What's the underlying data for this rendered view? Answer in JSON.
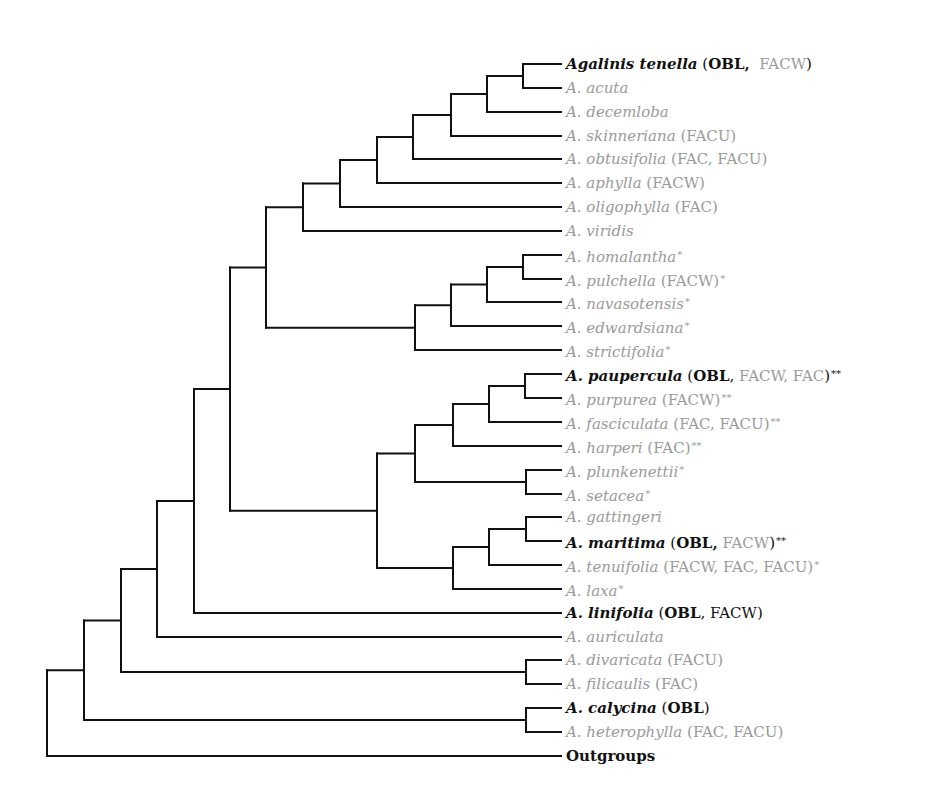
{
  "colors": {
    "branch": "#111111",
    "dark_text": "#111111",
    "gray_text": "#9a9a9a",
    "background": "#ffffff"
  },
  "leaves": [
    {
      "y": 64,
      "dark": true,
      "name": "Agalinis tenella",
      "tokens": [
        {
          "t": " (",
          "c": "dark"
        },
        {
          "t": "OBL,",
          "c": "bold"
        },
        {
          "t": "  FACW",
          "c": "gray"
        },
        {
          "t": ")",
          "c": "dark"
        }
      ],
      "mark": ""
    },
    {
      "y": 88,
      "dark": false,
      "name": "A. acuta",
      "tokens": [],
      "mark": ""
    },
    {
      "y": 112,
      "dark": false,
      "name": "A. decemloba",
      "tokens": [],
      "mark": ""
    },
    {
      "y": 136,
      "dark": false,
      "name": "A. skinneriana",
      "tokens": [
        {
          "t": " (FACU)",
          "c": "gray"
        }
      ],
      "mark": ""
    },
    {
      "y": 159,
      "dark": false,
      "name": "A. obtusifolia",
      "tokens": [
        {
          "t": " (FAC, FACU)",
          "c": "gray"
        }
      ],
      "mark": ""
    },
    {
      "y": 183,
      "dark": false,
      "name": "A. aphylla",
      "tokens": [
        {
          "t": " (FACW)",
          "c": "gray"
        }
      ],
      "mark": ""
    },
    {
      "y": 207,
      "dark": false,
      "name": "A. oligophylla",
      "tokens": [
        {
          "t": " (FAC)",
          "c": "gray"
        }
      ],
      "mark": ""
    },
    {
      "y": 231,
      "dark": false,
      "name": "A. viridis",
      "tokens": [],
      "mark": ""
    },
    {
      "y": 255,
      "dark": false,
      "name": "A. homalantha",
      "tokens": [],
      "mark": "*"
    },
    {
      "y": 279,
      "dark": false,
      "name": "A. pulchella",
      "tokens": [
        {
          "t": " (FACW)",
          "c": "gray"
        }
      ],
      "mark": "*"
    },
    {
      "y": 302,
      "dark": false,
      "name": "A. navasotensis",
      "tokens": [],
      "mark": "*"
    },
    {
      "y": 326,
      "dark": false,
      "name": "A. edwardsiana",
      "tokens": [],
      "mark": "*"
    },
    {
      "y": 350,
      "dark": false,
      "name": "A. strictifolia",
      "tokens": [],
      "mark": "*"
    },
    {
      "y": 374,
      "dark": true,
      "name": "A. paupercula",
      "tokens": [
        {
          "t": " (",
          "c": "dark"
        },
        {
          "t": "OBL",
          "c": "bold"
        },
        {
          "t": ",",
          "c": "dark"
        },
        {
          "t": " FACW, FAC",
          "c": "gray"
        },
        {
          "t": ")",
          "c": "dark"
        }
      ],
      "mark": "**"
    },
    {
      "y": 398,
      "dark": false,
      "name": "A. purpurea",
      "tokens": [
        {
          "t": " (FACW)",
          "c": "gray"
        }
      ],
      "mark": "**"
    },
    {
      "y": 422,
      "dark": false,
      "name": "A. fasciculata",
      "tokens": [
        {
          "t": " (FAC, FACU)",
          "c": "gray"
        }
      ],
      "mark": "**"
    },
    {
      "y": 446,
      "dark": false,
      "name": "A. harperi",
      "tokens": [
        {
          "t": " (FAC)",
          "c": "gray"
        }
      ],
      "mark": "**"
    },
    {
      "y": 470,
      "dark": false,
      "name": "A. plunkenettii",
      "tokens": [],
      "mark": "*"
    },
    {
      "y": 494,
      "dark": false,
      "name": "A. setacea",
      "tokens": [],
      "mark": "*"
    },
    {
      "y": 517,
      "dark": false,
      "name": "A. gattingeri",
      "tokens": [],
      "mark": ""
    },
    {
      "y": 541,
      "dark": true,
      "name": "A. maritima",
      "tokens": [
        {
          "t": " (",
          "c": "dark"
        },
        {
          "t": "OBL,",
          "c": "bold"
        },
        {
          "t": " FACW",
          "c": "gray"
        },
        {
          "t": ")",
          "c": "dark"
        }
      ],
      "mark": "**"
    },
    {
      "y": 565,
      "dark": false,
      "name": "A. tenuifolia",
      "tokens": [
        {
          "t": " (FACW, FAC, FACU)",
          "c": "gray"
        }
      ],
      "mark": "*"
    },
    {
      "y": 589,
      "dark": false,
      "name": "A. laxa",
      "tokens": [],
      "mark": "*"
    },
    {
      "y": 613,
      "dark": true,
      "name": "A. linifolia",
      "tokens": [
        {
          "t": " (",
          "c": "dark"
        },
        {
          "t": "OBL",
          "c": "bold"
        },
        {
          "t": ", FACW)",
          "c": "dark"
        }
      ],
      "mark": ""
    },
    {
      "y": 637,
      "dark": false,
      "name": "A. auriculata",
      "tokens": [],
      "mark": ""
    },
    {
      "y": 660,
      "dark": false,
      "name": "A. divaricata",
      "tokens": [
        {
          "t": " (FACU)",
          "c": "gray"
        }
      ],
      "mark": ""
    },
    {
      "y": 684,
      "dark": false,
      "name": "A. filicaulis",
      "tokens": [
        {
          "t": " (FAC)",
          "c": "gray"
        }
      ],
      "mark": ""
    },
    {
      "y": 708,
      "dark": true,
      "name": "A. calycina",
      "tokens": [
        {
          "t": " (",
          "c": "dark"
        },
        {
          "t": "OBL",
          "c": "bold"
        },
        {
          "t": ")",
          "c": "dark"
        }
      ],
      "mark": ""
    },
    {
      "y": 732,
      "dark": false,
      "name": "A. heterophylla",
      "tokens": [
        {
          "t": " (FAC, FACU)",
          "c": "gray"
        }
      ],
      "mark": ""
    },
    {
      "y": 756,
      "dark": true,
      "outgroup": true,
      "name": "Outgroups",
      "tokens": [],
      "mark": ""
    }
  ],
  "tree": {
    "leaf_x_end": 561,
    "nodes": [
      {
        "id": "n_ten_acu",
        "x": 523,
        "children": [
          {
            "leaf": 0
          },
          {
            "leaf": 1
          }
        ]
      },
      {
        "id": "n_dec",
        "x": 487,
        "children": [
          {
            "node": "n_ten_acu"
          },
          {
            "leaf": 2
          }
        ]
      },
      {
        "id": "n_ski",
        "x": 451,
        "children": [
          {
            "node": "n_dec"
          },
          {
            "leaf": 3
          }
        ]
      },
      {
        "id": "n_obt",
        "x": 413,
        "children": [
          {
            "node": "n_ski"
          },
          {
            "leaf": 4
          }
        ]
      },
      {
        "id": "n_aph",
        "x": 377,
        "children": [
          {
            "node": "n_obt"
          },
          {
            "leaf": 5
          }
        ]
      },
      {
        "id": "n_oli",
        "x": 340,
        "children": [
          {
            "node": "n_aph"
          },
          {
            "leaf": 6
          }
        ]
      },
      {
        "id": "n_vir",
        "x": 303,
        "children": [
          {
            "node": "n_oli"
          },
          {
            "leaf": 7
          }
        ]
      },
      {
        "id": "n_hom_pul",
        "x": 523,
        "children": [
          {
            "leaf": 8
          },
          {
            "leaf": 9
          }
        ]
      },
      {
        "id": "n_nav",
        "x": 487,
        "children": [
          {
            "node": "n_hom_pul"
          },
          {
            "leaf": 10
          }
        ]
      },
      {
        "id": "n_edw",
        "x": 451,
        "children": [
          {
            "node": "n_nav"
          },
          {
            "leaf": 11
          }
        ]
      },
      {
        "id": "n_str",
        "x": 415,
        "children": [
          {
            "node": "n_edw"
          },
          {
            "leaf": 12
          }
        ]
      },
      {
        "id": "n_upper",
        "x": 266,
        "children": [
          {
            "node": "n_vir"
          },
          {
            "node": "n_str"
          }
        ]
      },
      {
        "id": "n_pau_pur",
        "x": 525,
        "children": [
          {
            "leaf": 13
          },
          {
            "leaf": 14
          }
        ]
      },
      {
        "id": "n_fas",
        "x": 489,
        "children": [
          {
            "node": "n_pau_pur"
          },
          {
            "leaf": 15
          }
        ]
      },
      {
        "id": "n_har",
        "x": 453,
        "children": [
          {
            "node": "n_fas"
          },
          {
            "leaf": 16
          }
        ]
      },
      {
        "id": "n_plu_set",
        "x": 526,
        "children": [
          {
            "leaf": 17
          },
          {
            "leaf": 18
          }
        ]
      },
      {
        "id": "n_ps_join",
        "x": 415,
        "children": [
          {
            "node": "n_har"
          },
          {
            "node": "n_plu_set"
          }
        ]
      },
      {
        "id": "n_gat_mar",
        "x": 526,
        "children": [
          {
            "leaf": 19
          },
          {
            "leaf": 20
          }
        ]
      },
      {
        "id": "n_ten",
        "x": 489,
        "children": [
          {
            "node": "n_gat_mar"
          },
          {
            "leaf": 21
          }
        ]
      },
      {
        "id": "n_lax",
        "x": 453,
        "children": [
          {
            "node": "n_ten"
          },
          {
            "leaf": 22
          }
        ]
      },
      {
        "id": "n_lower",
        "x": 377,
        "children": [
          {
            "node": "n_ps_join"
          },
          {
            "node": "n_lax"
          }
        ]
      },
      {
        "id": "n_core",
        "x": 230,
        "children": [
          {
            "node": "n_upper"
          },
          {
            "node": "n_lower"
          }
        ]
      },
      {
        "id": "n_lin",
        "x": 194,
        "children": [
          {
            "node": "n_core"
          },
          {
            "leaf": 23
          }
        ]
      },
      {
        "id": "n_aur",
        "x": 157,
        "children": [
          {
            "node": "n_lin"
          },
          {
            "leaf": 24
          }
        ]
      },
      {
        "id": "n_div_fil",
        "x": 526,
        "children": [
          {
            "leaf": 25
          },
          {
            "leaf": 26
          }
        ]
      },
      {
        "id": "n_df_join",
        "x": 121,
        "children": [
          {
            "node": "n_aur"
          },
          {
            "node": "n_div_fil"
          }
        ]
      },
      {
        "id": "n_cal_het",
        "x": 526,
        "children": [
          {
            "leaf": 27
          },
          {
            "leaf": 28
          }
        ]
      },
      {
        "id": "n_ch_join",
        "x": 84,
        "children": [
          {
            "node": "n_df_join"
          },
          {
            "node": "n_cal_het"
          }
        ]
      },
      {
        "id": "n_root",
        "x": 47,
        "children": [
          {
            "node": "n_ch_join"
          },
          {
            "leaf": 29
          }
        ]
      }
    ]
  }
}
